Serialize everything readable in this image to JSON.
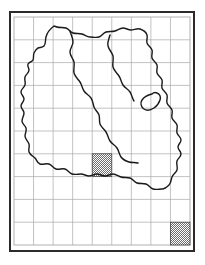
{
  "figure": {
    "kind": "distribution-map",
    "title": "",
    "caption": "",
    "frame": {
      "border_color": "#2b2b2b",
      "border_width_px": 2,
      "background": "#ffffff"
    }
  },
  "grid": {
    "columns": 9,
    "rows": 10,
    "line_color": "#a9a9a9",
    "line_width_px": 0.7,
    "visible": true,
    "column_labels": [],
    "row_labels": []
  },
  "map": {
    "outline_color": "#1a1a1a",
    "outline_width_px": 1.4,
    "fill": "none",
    "region_count": 3,
    "internal_boundaries": true,
    "region_labels": []
  },
  "occurrences": {
    "symbol_name": "stippled-square",
    "fill_pattern": "checker-stipple",
    "pattern_color": "#6e6e6e",
    "pattern_background": "#ffffff",
    "outline_color": "#3a3a3a",
    "count": 1,
    "cells": [
      {
        "name": "record-cell-1",
        "col": 5,
        "row": 7
      }
    ]
  },
  "legend": {
    "visible": true,
    "label": "",
    "swatch_name": "stippled-square",
    "position": "bottom-right",
    "cells": [
      {
        "name": "legend-cell",
        "col": 9,
        "row": 10
      }
    ]
  },
  "chart_data": {
    "type": "heatmap",
    "title": "",
    "xlabel": "",
    "ylabel": "",
    "grid": true,
    "legend_position": "bottom-right",
    "categories_x": [
      "1",
      "2",
      "3",
      "4",
      "5",
      "6",
      "7",
      "8",
      "9"
    ],
    "categories_y": [
      "1",
      "2",
      "3",
      "4",
      "5",
      "6",
      "7",
      "8",
      "9",
      "10"
    ],
    "values": [
      [
        0,
        0,
        0,
        0,
        0,
        0,
        0,
        0,
        0
      ],
      [
        0,
        0,
        0,
        0,
        0,
        0,
        0,
        0,
        0
      ],
      [
        0,
        0,
        0,
        0,
        0,
        0,
        0,
        0,
        0
      ],
      [
        0,
        0,
        0,
        0,
        0,
        0,
        0,
        0,
        0
      ],
      [
        0,
        0,
        0,
        0,
        0,
        0,
        0,
        0,
        0
      ],
      [
        0,
        0,
        0,
        0,
        0,
        0,
        0,
        0,
        0
      ],
      [
        0,
        0,
        0,
        0,
        0,
        0,
        0,
        0,
        0
      ],
      [
        0,
        0,
        0,
        0,
        1,
        0,
        0,
        0,
        0
      ],
      [
        0,
        0,
        0,
        0,
        0,
        0,
        0,
        0,
        0
      ],
      [
        0,
        0,
        0,
        0,
        0,
        0,
        0,
        0,
        1
      ]
    ],
    "value_meaning": {
      "0": "absent",
      "1": "recorded"
    }
  }
}
